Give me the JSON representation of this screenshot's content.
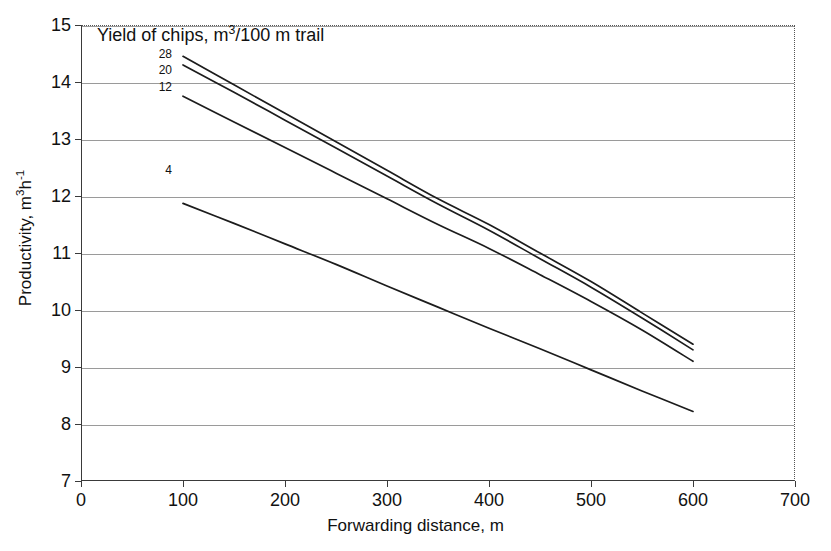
{
  "chart_data": {
    "type": "line",
    "title": "Yield of chips,  m3/100 m trail",
    "title_html_parts": {
      "prefix": "Yield of chips,  m",
      "exponent": "3",
      "suffix": "/100 m trail"
    },
    "xlabel": "Forwarding distance, m",
    "ylabel": "Productivity, m3h-1",
    "ylabel_html_parts": {
      "prefix": "Productivity, m",
      "sup1": "3",
      "mid": "h",
      "sup2": "-1"
    },
    "xlim": [
      0,
      700
    ],
    "ylim": [
      7,
      15
    ],
    "xticks": [
      0,
      100,
      200,
      300,
      400,
      500,
      600,
      700
    ],
    "yticks": [
      7,
      8,
      9,
      10,
      11,
      12,
      13,
      14,
      15
    ],
    "grid": "horizontal",
    "legend_position": "inline-left-labels",
    "x": [
      100,
      150,
      200,
      250,
      300,
      350,
      400,
      450,
      500,
      550,
      600
    ],
    "series": [
      {
        "name": "28",
        "label": "28",
        "values": [
          14.45,
          13.95,
          13.45,
          12.95,
          12.45,
          11.95,
          11.5,
          11.0,
          10.5,
          9.95,
          9.4
        ]
      },
      {
        "name": "20",
        "label": "20",
        "values": [
          14.3,
          13.82,
          13.33,
          12.84,
          12.35,
          11.86,
          11.4,
          10.9,
          10.4,
          9.86,
          9.3
        ]
      },
      {
        "name": "12",
        "label": "12",
        "values": [
          13.75,
          13.3,
          12.85,
          12.4,
          11.95,
          11.5,
          11.08,
          10.62,
          10.15,
          9.65,
          9.1
        ]
      },
      {
        "name": "4",
        "label": "4",
        "values": [
          11.87,
          11.52,
          11.16,
          10.8,
          10.42,
          10.05,
          9.68,
          9.32,
          8.95,
          8.58,
          8.22
        ]
      }
    ]
  },
  "axes": {
    "x_tick_labels": [
      "0",
      "100",
      "200",
      "300",
      "400",
      "500",
      "600",
      "700"
    ],
    "y_tick_labels": [
      "7",
      "8",
      "9",
      "10",
      "11",
      "12",
      "13",
      "14",
      "15"
    ]
  },
  "colors": {
    "curve": "#1c1c1c",
    "grid": "#9a9a9a",
    "axis": "#3a3a3a",
    "text": "#111111",
    "background": "#ffffff"
  }
}
